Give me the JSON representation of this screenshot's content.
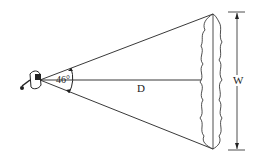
{
  "diagram": {
    "angle_label": "46°",
    "distance_label": "D",
    "width_label": "W",
    "colors": {
      "stroke": "#222222",
      "background": "#ffffff"
    }
  }
}
